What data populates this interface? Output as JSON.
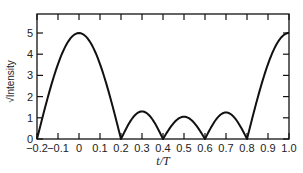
{
  "chart_data": {
    "type": "line",
    "title": "",
    "xlabel": "t/T",
    "ylabel": "√Intensity",
    "xlim": [
      -0.2,
      1.0
    ],
    "ylim": [
      0,
      5.8
    ],
    "x_ticks": [
      "-0.2",
      "-0.1",
      "0",
      "0.1",
      "0.2",
      "0.3",
      "0.4",
      "0.5",
      "0.6",
      "0.7",
      "0.8",
      "0.9",
      "1.0"
    ],
    "y_ticks": [
      "0",
      "1",
      "2",
      "3",
      "4",
      "5"
    ],
    "grid": false,
    "legend": null,
    "series": [
      {
        "name": "√Intensity",
        "x": [
          -0.2,
          -0.15,
          -0.1,
          -0.05,
          0.0,
          0.05,
          0.1,
          0.15,
          0.2,
          0.25,
          0.3,
          0.35,
          0.4,
          0.45,
          0.5,
          0.55,
          0.6,
          0.65,
          0.7,
          0.75,
          0.8,
          0.85,
          0.9,
          0.95,
          1.0
        ],
        "values": [
          0,
          1.55,
          3.0,
          4.3,
          5.0,
          4.3,
          3.0,
          1.55,
          0,
          0.95,
          1.3,
          0.95,
          0,
          0.75,
          1.05,
          0.75,
          0,
          0.9,
          1.25,
          0.9,
          0,
          1.55,
          3.0,
          4.3,
          5.0
        ]
      }
    ]
  }
}
